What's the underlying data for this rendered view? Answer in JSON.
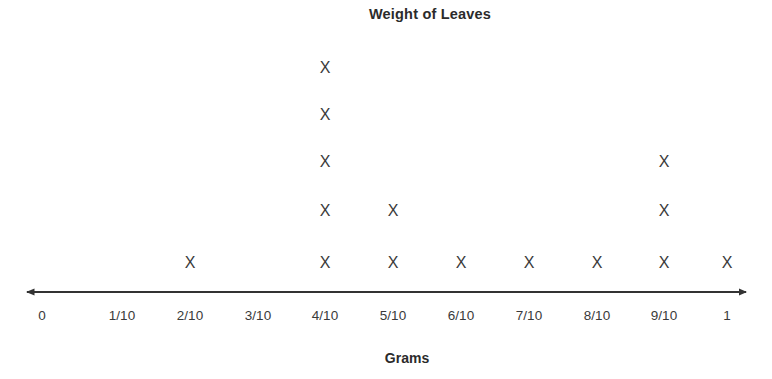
{
  "chart_data": {
    "type": "dotplot",
    "title": "Weight of Leaves",
    "xlabel": "Grams",
    "ylabel": "",
    "marker": "X",
    "categories": [
      "0",
      "1/10",
      "2/10",
      "3/10",
      "4/10",
      "5/10",
      "6/10",
      "7/10",
      "8/10",
      "9/10",
      "1"
    ],
    "values": [
      0,
      0,
      1,
      0,
      5,
      2,
      1,
      1,
      1,
      3,
      1
    ],
    "x_numeric": [
      0,
      0.1,
      0.2,
      0.3,
      0.4,
      0.5,
      0.6,
      0.7,
      0.8,
      0.9,
      1
    ],
    "xlim": [
      0,
      1
    ],
    "ylim": [
      0,
      5
    ],
    "grid": false,
    "legend": null,
    "axis_style": "double-arrow-number-line",
    "total_count": 15,
    "colors": {
      "marker": "#3a3a3a",
      "axis": "#333333",
      "title": "#2b2b2b",
      "tick_label": "#3a3a3a",
      "background": "#ffffff"
    }
  },
  "layout": {
    "tick_positions_px": [
      42,
      122,
      190,
      258,
      325,
      393,
      461,
      529,
      597,
      664,
      727
    ],
    "row_positions_px": [
      263,
      211,
      162,
      115,
      68
    ],
    "axis_left_px": 18,
    "axis_right_px": 755,
    "axis_y_px": 292
  }
}
